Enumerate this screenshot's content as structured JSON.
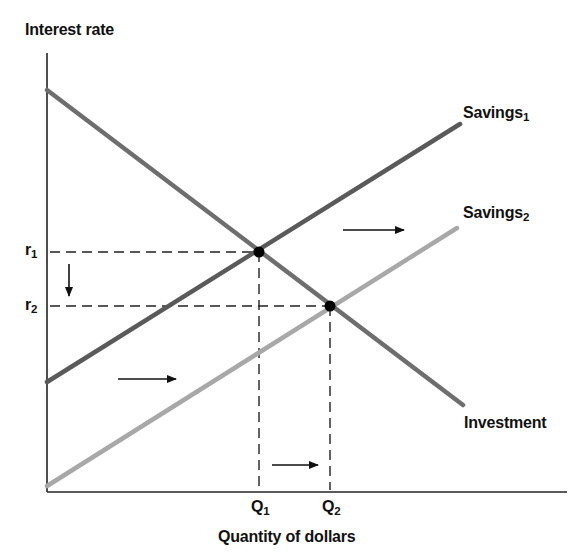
{
  "diagram": {
    "y_axis_label": "Interest rate",
    "x_axis_label": "Quantity of dollars",
    "curves": [
      {
        "name": "Savings",
        "subscript": "1",
        "color": "#5a5a5a"
      },
      {
        "name": "Savings",
        "subscript": "2",
        "color": "#a8a8a8"
      },
      {
        "name": "Investment",
        "subscript": "",
        "color": "#6e6e6e"
      }
    ],
    "y_ticks": [
      {
        "symbol": "r",
        "subscript": "1"
      },
      {
        "symbol": "r",
        "subscript": "2"
      }
    ],
    "x_ticks": [
      {
        "symbol": "Q",
        "subscript": "1"
      },
      {
        "symbol": "Q",
        "subscript": "2"
      }
    ],
    "equilibria": [
      {
        "at": "r1, Q1",
        "between": "Savings1 and Investment"
      },
      {
        "at": "r2, Q2",
        "between": "Savings2 and Investment"
      }
    ],
    "arrows": [
      {
        "meaning": "savings shift right (upper)",
        "direction": "right"
      },
      {
        "meaning": "savings shift right (lower)",
        "direction": "right"
      },
      {
        "meaning": "interest rate falls",
        "direction": "down"
      },
      {
        "meaning": "quantity rises",
        "direction": "right"
      }
    ]
  }
}
